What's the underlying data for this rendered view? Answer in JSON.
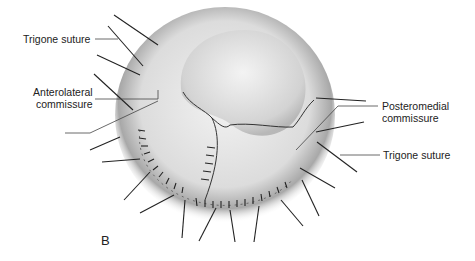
{
  "figure": {
    "panel_label": "B",
    "labels": {
      "trigone_suture_left": "Trigone suture",
      "anterolateral_line1": "Anterolateral",
      "anterolateral_line2": "commissure",
      "posteromedial_line1": "Posteromedial",
      "posteromedial_line2": "commissure",
      "trigone_suture_right": "Trigone suture"
    }
  }
}
